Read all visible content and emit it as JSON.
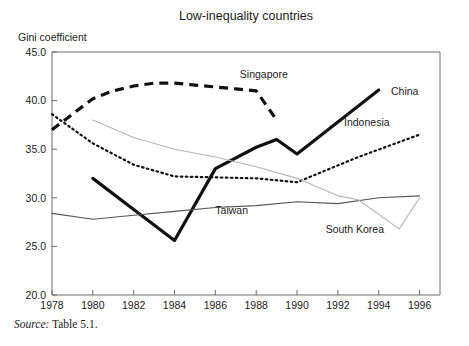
{
  "chart_data": {
    "type": "line",
    "title": "Low-inequality countries",
    "ylabel": "Gini coefficient",
    "xlabel": "",
    "xlim": [
      1978,
      1997
    ],
    "ylim": [
      20.0,
      45.0
    ],
    "grid": false,
    "legend": "inline-annotations",
    "y_ticks": [
      "20.0",
      "25.0",
      "30.0",
      "35.0",
      "40.0",
      "45.0"
    ],
    "y_tick_values": [
      20.0,
      25.0,
      30.0,
      35.0,
      40.0,
      45.0
    ],
    "x_ticks": [
      "1978",
      "1980",
      "1982",
      "1984",
      "1986",
      "1988",
      "1990",
      "1992",
      "1994",
      "1996"
    ],
    "x_tick_values": [
      1978,
      1980,
      1982,
      1984,
      1986,
      1988,
      1990,
      1992,
      1994,
      1996
    ],
    "series": [
      {
        "name": "Singapore",
        "style": "dashed-thick",
        "color": "#111111",
        "label_x": 1987.2,
        "label_y": 42.3,
        "x": [
          1978,
          1979,
          1980,
          1981,
          1982,
          1983,
          1984,
          1985,
          1986,
          1987,
          1988,
          1989
        ],
        "values": [
          37.0,
          38.6,
          40.2,
          41.0,
          41.5,
          41.8,
          41.8,
          41.6,
          41.4,
          41.2,
          41.0,
          38.0
        ]
      },
      {
        "name": "China",
        "style": "solid-thick",
        "color": "#111111",
        "label_x": 1994.6,
        "label_y": 40.6,
        "x": [
          1980,
          1982,
          1984,
          1986,
          1988,
          1989,
          1990,
          1992,
          1994
        ],
        "values": [
          32.0,
          28.8,
          25.6,
          33.0,
          35.2,
          36.0,
          34.5,
          37.8,
          41.1
        ]
      },
      {
        "name": "Indonesia",
        "style": "dotted",
        "color": "#111111",
        "label_x": 1992.3,
        "label_y": 37.4,
        "x": [
          1978,
          1980,
          1982,
          1984,
          1986,
          1988,
          1990,
          1993,
          1996
        ],
        "values": [
          38.6,
          35.6,
          33.4,
          32.2,
          32.1,
          32.0,
          31.6,
          34.2,
          36.5
        ]
      },
      {
        "name": "Taiwan",
        "style": "solid-thin-dark",
        "color": "#555555",
        "label_x": 1986.0,
        "label_y": 28.3,
        "x": [
          1978,
          1980,
          1982,
          1984,
          1986,
          1988,
          1990,
          1992,
          1994,
          1996
        ],
        "values": [
          28.4,
          27.8,
          28.2,
          28.6,
          29.0,
          29.2,
          29.6,
          29.4,
          30.0,
          30.2
        ]
      },
      {
        "name": "South Korea",
        "style": "solid-thin-light",
        "color": "#b5b5b5",
        "label_x": 1991.4,
        "label_y": 26.4,
        "x": [
          1980,
          1982,
          1984,
          1986,
          1988,
          1990,
          1992,
          1993,
          1995,
          1996
        ],
        "values": [
          38.0,
          36.2,
          35.0,
          34.2,
          33.2,
          32.0,
          30.2,
          29.8,
          26.8,
          30.0
        ]
      }
    ]
  },
  "source": {
    "label": "Source:",
    "text": "Table 5.1."
  }
}
